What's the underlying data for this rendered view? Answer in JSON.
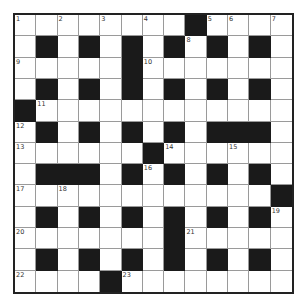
{
  "puzzle": {
    "type": "crossword",
    "rows": 13,
    "cols": 13,
    "colors": {
      "black": "#1a1a1a",
      "white": "#ffffff",
      "border": "#222222",
      "gridline": "#9a9a9a"
    },
    "layout": [
      "WWWWWWWWBWWWW",
      "WBWBWBWBWBWBW",
      "WWWWWBWWWWWWW",
      "WBWBWBWBWBWBW",
      "BWWWWWWWWWWWW",
      "WBWBWBWBWBBBW",
      "WWWWWWBWWWWWW",
      "WBBBWBWBWBWBW",
      "WWWWWWWWWWWWB",
      "WBWBWBWBWBWBW",
      "WWWWWWWBWWWWW",
      "WBWBWBWBWBWBW",
      "WWWWBWWWWWWWW"
    ],
    "numbers": [
      {
        "r": 0,
        "c": 0,
        "n": "1"
      },
      {
        "r": 0,
        "c": 2,
        "n": "2"
      },
      {
        "r": 0,
        "c": 4,
        "n": "3"
      },
      {
        "r": 0,
        "c": 6,
        "n": "4"
      },
      {
        "r": 0,
        "c": 9,
        "n": "5"
      },
      {
        "r": 0,
        "c": 10,
        "n": "6"
      },
      {
        "r": 0,
        "c": 12,
        "n": "7"
      },
      {
        "r": 1,
        "c": 8,
        "n": "8"
      },
      {
        "r": 2,
        "c": 0,
        "n": "9"
      },
      {
        "r": 2,
        "c": 6,
        "n": "10"
      },
      {
        "r": 4,
        "c": 1,
        "n": "11"
      },
      {
        "r": 5,
        "c": 0,
        "n": "12"
      },
      {
        "r": 6,
        "c": 0,
        "n": "13"
      },
      {
        "r": 6,
        "c": 7,
        "n": "14"
      },
      {
        "r": 6,
        "c": 10,
        "n": "15"
      },
      {
        "r": 7,
        "c": 6,
        "n": "16"
      },
      {
        "r": 8,
        "c": 0,
        "n": "17"
      },
      {
        "r": 8,
        "c": 2,
        "n": "18"
      },
      {
        "r": 9,
        "c": 12,
        "n": "19"
      },
      {
        "r": 10,
        "c": 0,
        "n": "20"
      },
      {
        "r": 10,
        "c": 8,
        "n": "21"
      },
      {
        "r": 12,
        "c": 0,
        "n": "22"
      },
      {
        "r": 12,
        "c": 5,
        "n": "23"
      }
    ]
  }
}
